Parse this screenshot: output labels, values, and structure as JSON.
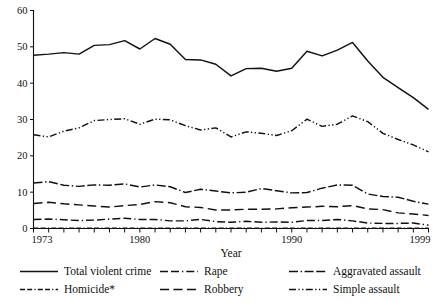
{
  "chart_data": {
    "type": "line",
    "title": "",
    "xlabel": "Year",
    "ylabel": "",
    "xlim": [
      1973,
      1999
    ],
    "ylim": [
      0,
      60
    ],
    "grid": false,
    "legend_position": "bottom",
    "y_ticks": [
      0,
      10,
      20,
      30,
      40,
      50,
      60
    ],
    "x_ticks": [
      1973,
      1974,
      1975,
      1976,
      1977,
      1978,
      1979,
      1980,
      1981,
      1982,
      1983,
      1984,
      1985,
      1986,
      1987,
      1988,
      1989,
      1990,
      1991,
      1992,
      1993,
      1994,
      1995,
      1996,
      1997,
      1998,
      1999
    ],
    "x_tick_labels": [
      "1973",
      "",
      "",
      "",
      "",
      "",
      "",
      "1980",
      "",
      "",
      "",
      "",
      "",
      "",
      "",
      "",
      "",
      "1990",
      "",
      "",
      "",
      "",
      "",
      "",
      "",
      "",
      "1999"
    ],
    "x": [
      1973,
      1974,
      1975,
      1976,
      1977,
      1978,
      1979,
      1980,
      1981,
      1982,
      1983,
      1984,
      1985,
      1986,
      1987,
      1988,
      1989,
      1990,
      1991,
      1992,
      1993,
      1994,
      1995,
      1996,
      1997,
      1998,
      1999
    ],
    "series": [
      {
        "name": "Total violent crime",
        "dash": "solid",
        "values": [
          47.7,
          48.0,
          48.4,
          48.0,
          50.4,
          50.6,
          51.7,
          49.4,
          52.3,
          50.7,
          46.5,
          46.4,
          45.2,
          42.0,
          44.0,
          44.1,
          43.3,
          44.1,
          48.8,
          47.5,
          49.1,
          51.2,
          46.1,
          41.6,
          38.8,
          36.0,
          32.8
        ]
      },
      {
        "name": "Homicide*",
        "dash": "homicide",
        "values": [
          0.09,
          0.1,
          0.1,
          0.09,
          0.09,
          0.09,
          0.1,
          0.1,
          0.1,
          0.09,
          0.08,
          0.08,
          0.08,
          0.09,
          0.08,
          0.08,
          0.09,
          0.09,
          0.1,
          0.09,
          0.09,
          0.09,
          0.08,
          0.07,
          0.07,
          0.06,
          0.06
        ]
      },
      {
        "name": "Rape",
        "dash": "rape",
        "values": [
          2.5,
          2.6,
          2.4,
          2.2,
          2.3,
          2.6,
          2.8,
          2.5,
          2.5,
          2.1,
          2.1,
          2.5,
          1.9,
          1.7,
          2.0,
          1.7,
          1.8,
          1.7,
          2.2,
          2.2,
          2.5,
          2.1,
          1.5,
          1.4,
          1.4,
          1.5,
          0.9
        ]
      },
      {
        "name": "Robbery",
        "dash": "robbery",
        "values": [
          6.9,
          7.2,
          6.8,
          6.5,
          6.2,
          5.9,
          6.3,
          6.6,
          7.4,
          7.1,
          6.0,
          5.8,
          5.1,
          5.1,
          5.3,
          5.3,
          5.4,
          5.7,
          5.9,
          6.1,
          6.0,
          6.3,
          5.4,
          5.2,
          4.3,
          4.0,
          3.6
        ]
      },
      {
        "name": "Aggravated assault",
        "dash": "aggravated",
        "values": [
          12.5,
          12.9,
          11.9,
          11.6,
          12.0,
          11.9,
          12.3,
          11.4,
          12.0,
          11.5,
          9.9,
          10.8,
          10.3,
          9.8,
          10.0,
          11.0,
          10.4,
          9.8,
          9.9,
          11.1,
          12.0,
          11.9,
          9.5,
          8.8,
          8.6,
          7.5,
          6.7
        ]
      },
      {
        "name": "Simple assault",
        "dash": "simple",
        "values": [
          25.8,
          25.2,
          26.8,
          27.7,
          29.7,
          30.0,
          30.2,
          28.7,
          30.1,
          29.9,
          28.3,
          27.1,
          27.7,
          25.2,
          26.6,
          26.2,
          25.6,
          26.9,
          30.1,
          28.1,
          28.7,
          31.0,
          29.4,
          26.2,
          24.5,
          23.0,
          21.1
        ]
      }
    ]
  },
  "legend": {
    "items": [
      {
        "label": "Total violent crime",
        "dash": "solid"
      },
      {
        "label": "Homicide*",
        "dash": "homicide"
      },
      {
        "label": "Rape",
        "dash": "rape"
      },
      {
        "label": "Robbery",
        "dash": "robbery"
      },
      {
        "label": "Aggravated assault",
        "dash": "aggravated"
      },
      {
        "label": "Simple assault",
        "dash": "simple"
      }
    ]
  },
  "colors": {
    "ink": "#111111",
    "background": "#ffffff"
  }
}
